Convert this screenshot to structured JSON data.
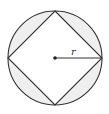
{
  "diagram": {
    "radius_label": "r",
    "colors": {
      "stroke": "#333333",
      "segment_fill": "#efefef",
      "square_fill": "#ffffff",
      "background": "#ffffff"
    },
    "circle": {
      "cx": 55,
      "cy": 58,
      "r": 47
    },
    "square_vertices": [
      [
        55,
        11
      ],
      [
        102,
        58
      ],
      [
        55,
        105
      ],
      [
        8,
        58
      ]
    ],
    "center_dot": {
      "cx": 55,
      "cy": 58
    },
    "radius_line": {
      "x1": 55,
      "y1": 58,
      "x2": 102,
      "y2": 58
    },
    "label_position": {
      "x": 73,
      "y": 55
    }
  }
}
